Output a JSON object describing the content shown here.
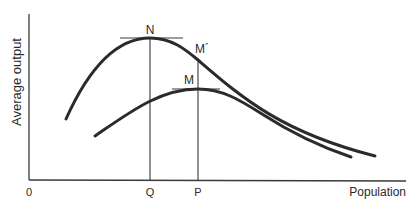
{
  "diagram": {
    "axes": {
      "y_label": "Average output",
      "x_label": "Population",
      "origin_label": "0"
    },
    "x_ticks": [
      {
        "label": "Q"
      },
      {
        "label": "P"
      }
    ],
    "points": {
      "n": "N",
      "m": "M",
      "m_prime": "M´"
    },
    "curves": [
      {
        "name": "upper-average-output-curve",
        "peak": "N",
        "peak_x_tick": "Q"
      },
      {
        "name": "lower-average-output-curve",
        "peak": "M",
        "peak_x_tick": "P"
      }
    ],
    "colors": {
      "ink": "#2b2b2b",
      "background": "#ffffff"
    }
  }
}
